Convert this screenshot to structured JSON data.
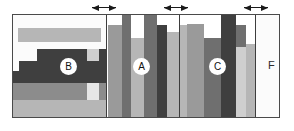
{
  "figure": {
    "title": "",
    "width": 294,
    "height": 131,
    "background": "#ffffff",
    "frame": {
      "x": 12,
      "y": 14,
      "width": 268,
      "height": 104,
      "border_color": "#4a4a4a"
    }
  },
  "palette": {
    "white": "#fbfbfb",
    "light_gray": "#cfcfcf",
    "mid_light_gray": "#b6b6b6",
    "mid_gray": "#9a9a9a",
    "gray": "#8c8c8c",
    "dark_gray": "#6f6f6f",
    "darkest_gray": "#3f3f3f",
    "outline": "#4a4a4a",
    "divider": "#3d3d3d",
    "marker": "#1a1a1a",
    "label_text": "#111111"
  },
  "markers": [
    {
      "name": "boundary-marker-1",
      "x": 92,
      "y": 4,
      "width": 24,
      "glyph": "double-arrow"
    },
    {
      "name": "boundary-marker-2",
      "x": 164,
      "y": 4,
      "width": 24,
      "glyph": "double-arrow"
    },
    {
      "name": "boundary-marker-3",
      "x": 244,
      "y": 4,
      "width": 24,
      "glyph": "double-arrow"
    }
  ],
  "regions": [
    {
      "id": "B",
      "name": "region-b",
      "label": "B",
      "label_x": 48,
      "label_y": 44,
      "orientation": "horizontal",
      "x": 0,
      "width": 93,
      "divider": false,
      "bands": [
        {
          "name": "band-b-1",
          "top": 0,
          "height": 13,
          "left": 0,
          "width": 93,
          "color": "#fbfbfb"
        },
        {
          "name": "band-b-2",
          "top": 13,
          "height": 14,
          "left": 0,
          "width": 5,
          "color": "#fbfbfb"
        },
        {
          "name": "band-b-3",
          "top": 13,
          "height": 14,
          "left": 5,
          "width": 83,
          "color": "#b6b6b6"
        },
        {
          "name": "band-b-4",
          "top": 13,
          "height": 14,
          "left": 88,
          "width": 5,
          "color": "#fbfbfb"
        },
        {
          "name": "band-b-5",
          "top": 27,
          "height": 7,
          "left": 0,
          "width": 93,
          "color": "#fbfbfb"
        },
        {
          "name": "band-b-6",
          "top": 34,
          "height": 12,
          "left": 0,
          "width": 24,
          "color": "#fbfbfb"
        },
        {
          "name": "band-b-7",
          "top": 34,
          "height": 12,
          "left": 24,
          "width": 50,
          "color": "#3f3f3f"
        },
        {
          "name": "band-b-8",
          "top": 34,
          "height": 12,
          "left": 74,
          "width": 12,
          "color": "#cfcfcf"
        },
        {
          "name": "band-b-9",
          "top": 34,
          "height": 12,
          "left": 86,
          "width": 7,
          "color": "#3f3f3f"
        },
        {
          "name": "band-b-10",
          "top": 46,
          "height": 10,
          "left": 0,
          "width": 6,
          "color": "#fbfbfb"
        },
        {
          "name": "band-b-11",
          "top": 46,
          "height": 10,
          "left": 6,
          "width": 87,
          "color": "#3f3f3f"
        },
        {
          "name": "band-b-12",
          "top": 56,
          "height": 12,
          "left": 0,
          "width": 93,
          "color": "#3f3f3f"
        },
        {
          "name": "band-b-13",
          "top": 68,
          "height": 17,
          "left": 0,
          "width": 74,
          "color": "#8c8c8c"
        },
        {
          "name": "band-b-14",
          "top": 68,
          "height": 17,
          "left": 74,
          "width": 12,
          "color": "#e6e6e6"
        },
        {
          "name": "band-b-15",
          "top": 68,
          "height": 17,
          "left": 86,
          "width": 7,
          "color": "#8c8c8c"
        },
        {
          "name": "band-b-16",
          "top": 85,
          "height": 19,
          "left": 0,
          "width": 93,
          "color": "#b6b6b6"
        }
      ]
    },
    {
      "id": "A",
      "name": "region-a",
      "label": "A",
      "label_x": 121,
      "label_y": 44,
      "orientation": "vertical",
      "x": 93,
      "width": 73,
      "divider": true,
      "bars": [
        {
          "name": "bar-a-1",
          "left": 1,
          "width": 14,
          "height": 92,
          "color": "#9a9a9a"
        },
        {
          "name": "bar-a-2",
          "left": 15,
          "width": 9,
          "height": 104,
          "color": "#6f6f6f"
        },
        {
          "name": "bar-a-3",
          "left": 24,
          "width": 13,
          "height": 79,
          "color": "#b6b6b6"
        },
        {
          "name": "bar-a-4",
          "left": 37,
          "width": 13,
          "height": 104,
          "color": "#6f6f6f"
        },
        {
          "name": "bar-a-5",
          "left": 50,
          "width": 10,
          "height": 92,
          "color": "#3f3f3f"
        },
        {
          "name": "bar-a-6",
          "left": 60,
          "width": 12,
          "height": 74,
          "color": "#cfcfcf"
        },
        {
          "name": "bar-a-6b",
          "left": 60,
          "width": 12,
          "height": 85,
          "color": "#b6b6b6"
        }
      ]
    },
    {
      "id": "C",
      "name": "region-c",
      "label": "C",
      "label_x": 197,
      "label_y": 44,
      "orientation": "vertical",
      "x": 166,
      "width": 76,
      "divider": true,
      "bars": [
        {
          "name": "bar-c-1",
          "left": 0,
          "width": 7,
          "height": 92,
          "color": "#b6b6b6"
        },
        {
          "name": "bar-c-2",
          "left": 7,
          "width": 17,
          "height": 93,
          "color": "#9a9a9a"
        },
        {
          "name": "bar-c-3",
          "left": 24,
          "width": 17,
          "height": 79,
          "color": "#6f6f6f"
        },
        {
          "name": "bar-c-4",
          "left": 41,
          "width": 15,
          "height": 104,
          "color": "#3f3f3f"
        },
        {
          "name": "bar-c-5",
          "left": 56,
          "width": 10,
          "height": 92,
          "color": "#6f6f6f"
        },
        {
          "name": "bar-c-5b",
          "left": 56,
          "width": 10,
          "height": 70,
          "color": "#cfcfcf"
        },
        {
          "name": "bar-c-6",
          "left": 66,
          "width": 10,
          "height": 73,
          "color": "#b6b6b6"
        }
      ]
    },
    {
      "id": "F",
      "name": "region-f",
      "label": "F",
      "label_x": 256,
      "label_y": 45,
      "orientation": "solid",
      "x": 242,
      "width": 26,
      "divider": true,
      "bands": [
        {
          "name": "band-f-1",
          "top": 0,
          "height": 104,
          "left": 0,
          "width": 26,
          "color": "#fbfbfb"
        }
      ]
    }
  ]
}
